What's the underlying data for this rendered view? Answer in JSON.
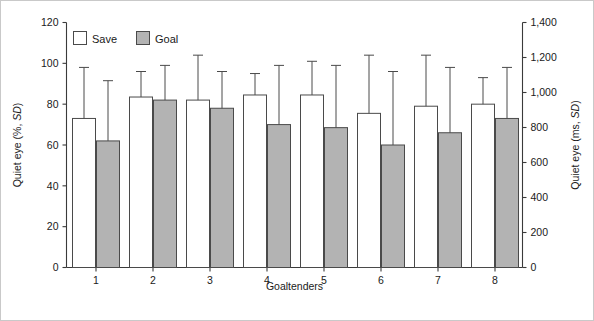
{
  "figure": {
    "background": "#ffffff",
    "frame_color": "#c9c9c9",
    "bar_save_color": "#ffffff",
    "bar_goal_color": "#b3b3b3",
    "bar_edge_color": "#4a4a4a"
  },
  "legend": {
    "position": "top-left inside plot",
    "entries": [
      {
        "label": "Save",
        "swatch": "white-square"
      },
      {
        "label": "Goal",
        "swatch": "gray-square"
      }
    ]
  },
  "chart_data": {
    "type": "bar",
    "title": "",
    "xlabel": "Goaltenders",
    "ylabel": "Quiet eye (%, SD)",
    "y2label": "Quiet eye (ms, SD)",
    "categories": [
      "1",
      "2",
      "3",
      "4",
      "5",
      "6",
      "7",
      "8"
    ],
    "ylim": [
      0,
      120
    ],
    "yticks": [
      0,
      20,
      40,
      60,
      80,
      100,
      120
    ],
    "yticklabels": [
      "0",
      "20",
      "40",
      "60",
      "80",
      "100",
      "120"
    ],
    "y2lim": [
      0,
      1400
    ],
    "y2ticks": [
      0,
      200,
      400,
      600,
      800,
      1000,
      1200,
      1400
    ],
    "y2ticklabels": [
      "0",
      "200",
      "400",
      "600",
      "800",
      "1,000",
      "1,200",
      "1,400"
    ],
    "grid": false,
    "errorbars": "upper-only (SD)",
    "series": [
      {
        "name": "Save",
        "color": "#ffffff",
        "values": [
          73,
          83.5,
          82,
          84.5,
          84.5,
          75.5,
          79,
          80
        ],
        "error_upper": [
          25,
          12.5,
          22,
          10.5,
          16.5,
          28.5,
          25,
          13
        ],
        "error_top_values": [
          98,
          96,
          104,
          95,
          101,
          104,
          104,
          93
        ]
      },
      {
        "name": "Goal",
        "color": "#b3b3b3",
        "values": [
          62,
          82,
          78,
          70,
          68.5,
          60,
          66,
          73
        ],
        "error_upper": [
          29.5,
          17,
          18,
          29,
          30.5,
          36,
          32,
          25
        ],
        "error_top_values": [
          91.5,
          99,
          96,
          99,
          99,
          96,
          98,
          98
        ]
      }
    ]
  }
}
